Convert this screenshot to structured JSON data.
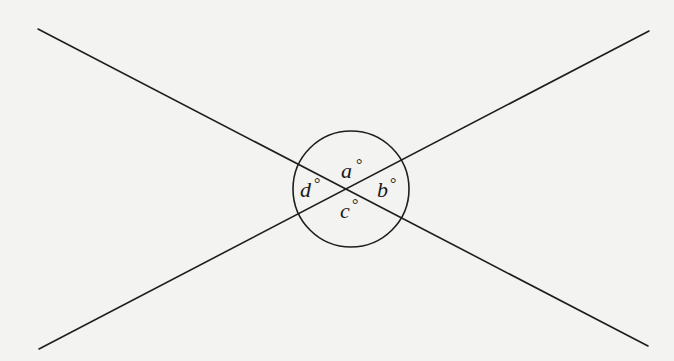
{
  "diagram": {
    "type": "intersecting-lines-with-circle",
    "background_color": "#f3f3f2",
    "stroke_color": "#1e1e1e",
    "lines": [
      {
        "name": "line-1",
        "x1": 38,
        "y1": 29,
        "x2": 648,
        "y2": 346
      },
      {
        "name": "line-2",
        "x1": 39,
        "y1": 349,
        "x2": 649,
        "y2": 31
      }
    ],
    "intersection": {
      "x": 349,
      "y": 188
    },
    "circle": {
      "cx": 351,
      "cy": 189,
      "r": 58
    },
    "angles": [
      {
        "name": "angle-a",
        "letter": "a",
        "symbol": "°",
        "x": 341,
        "y": 178,
        "deg_x": 356,
        "deg_y": 170,
        "position": "top"
      },
      {
        "name": "angle-b",
        "letter": "b",
        "symbol": "°",
        "x": 377,
        "y": 197,
        "deg_x": 390,
        "deg_y": 189,
        "position": "right"
      },
      {
        "name": "angle-c",
        "letter": "c",
        "symbol": "°",
        "x": 340,
        "y": 218,
        "deg_x": 352,
        "deg_y": 210,
        "position": "bottom"
      },
      {
        "name": "angle-d",
        "letter": "d",
        "symbol": "°",
        "x": 300,
        "y": 197,
        "deg_x": 314,
        "deg_y": 189,
        "position": "left"
      }
    ]
  }
}
